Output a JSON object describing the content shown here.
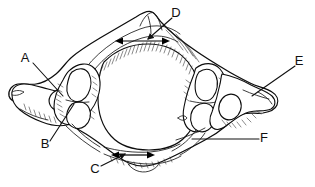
{
  "figure": {
    "background_color": "#ffffff",
    "line_color": "#0d0d0d",
    "label_color": "#111111",
    "view": "superior view line drawing"
  },
  "labels": [
    {
      "id": "A",
      "text": "A",
      "x": 25,
      "y": 59,
      "leader": {
        "x1": 33,
        "y1": 63,
        "x2": 63,
        "y2": 96
      },
      "points_to": "transverse-foramen-left"
    },
    {
      "id": "B",
      "text": "B",
      "x": 45,
      "y": 145,
      "leader": {
        "x1": 50,
        "y1": 141,
        "x2": 74,
        "y2": 104
      },
      "points_to": "left-lateral-mass"
    },
    {
      "id": "C",
      "text": "C",
      "x": 95,
      "y": 170,
      "leader": {
        "x1": 101,
        "y1": 166,
        "x2": 125,
        "y2": 154
      },
      "points_to": "anterior-arch-width-arrow"
    },
    {
      "id": "D",
      "text": "D",
      "x": 176,
      "y": 14,
      "leader": {
        "x1": 172,
        "y1": 18,
        "x2": 148,
        "y2": 39
      },
      "points_to": "posterior-arch-width-arrow"
    },
    {
      "id": "E",
      "text": "E",
      "x": 299,
      "y": 62,
      "leader": {
        "x1": 295,
        "y1": 66,
        "x2": 252,
        "y2": 96
      },
      "points_to": "right-transverse-process-tip"
    },
    {
      "id": "F",
      "text": "F",
      "x": 264,
      "y": 139,
      "leader": {
        "x1": 259,
        "y1": 139,
        "x2": 192,
        "y2": 139
      },
      "points_to": "right-inferior-margin"
    }
  ],
  "dimension_arrows": [
    {
      "name": "posterior-arch-span",
      "x1": 122,
      "y1": 41,
      "x2": 163,
      "y2": 41,
      "double_headed": true,
      "label_ref": "D"
    },
    {
      "name": "anterior-arch-span",
      "x1": 118,
      "y1": 155,
      "x2": 148,
      "y2": 155,
      "double_headed": true,
      "label_ref": "C"
    }
  ],
  "anatomy_regions": [
    {
      "name": "vertebral-foramen",
      "description": "large central opening"
    },
    {
      "name": "transverse-foramen-left",
      "description": "oval opening in left transverse process"
    },
    {
      "name": "transverse-foramen-right",
      "description": "oval opening in right transverse process"
    },
    {
      "name": "posterior-tubercle",
      "description": "upper midline projection"
    },
    {
      "name": "anterior-arch",
      "description": "lower midline arch"
    },
    {
      "name": "left-transverse-process",
      "description": "left lateral wing"
    },
    {
      "name": "right-transverse-process",
      "description": "right lateral wing"
    },
    {
      "name": "left-lateral-mass",
      "description": "left articular mass"
    },
    {
      "name": "right-lateral-mass",
      "description": "right articular mass"
    }
  ]
}
